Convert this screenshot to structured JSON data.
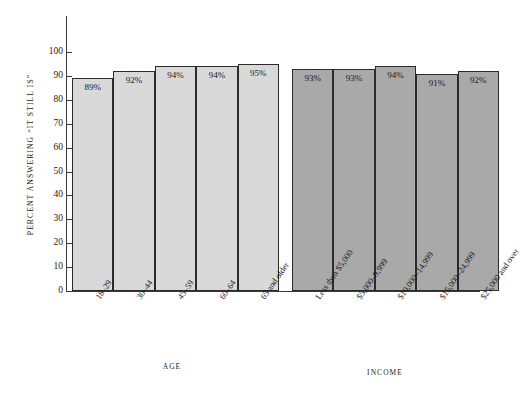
{
  "page": {
    "header_note": "",
    "axis_title_y": "PERCENT ANSWERING “IT STILL IS”"
  },
  "chart_data": {
    "type": "bar",
    "title": "",
    "subtitle": "",
    "xlabel": "",
    "ylabel": "PERCENT ANSWERING “IT STILL IS”",
    "ylim": [
      0,
      100
    ],
    "yticks": [
      0,
      10,
      20,
      30,
      40,
      50,
      60,
      70,
      80,
      90,
      100
    ],
    "ytick_labels": [
      "0",
      "10",
      "20",
      "30",
      "40",
      "50",
      "60",
      "70",
      "80",
      "90",
      "100"
    ],
    "grid": false,
    "legend": "none",
    "value_label_suffix": "%",
    "groups": [
      {
        "name": "AGE",
        "color": "#d9d9d9",
        "categories": [
          "18–29",
          "30–44",
          "45–59",
          "60–64",
          "65 and older"
        ],
        "values": [
          89,
          92,
          94,
          94,
          95
        ],
        "value_labels": [
          "89%",
          "92%",
          "94%",
          "94%",
          "95%"
        ]
      },
      {
        "name": "INCOME",
        "color": "#a9a9a9",
        "categories": [
          "Less than $5,000",
          "$5,000–9,999",
          "$10,000–14,999",
          "$15,000–24,999",
          "$25,000 and over"
        ],
        "values": [
          93,
          93,
          94,
          91,
          92
        ],
        "value_labels": [
          "93%",
          "93%",
          "94%",
          "91%",
          "92%"
        ]
      }
    ]
  }
}
